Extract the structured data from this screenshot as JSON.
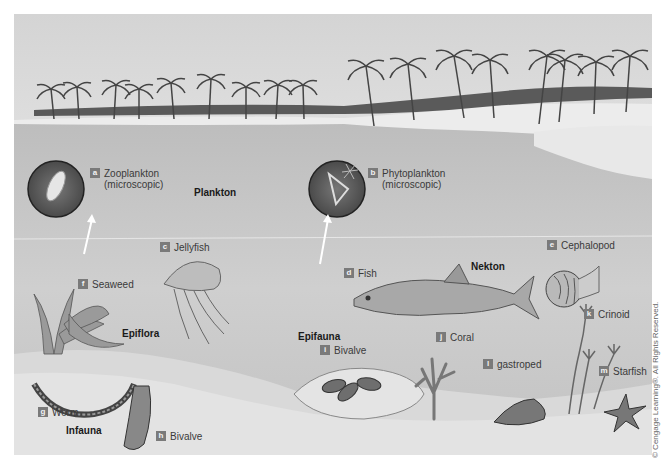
{
  "figure": {
    "colors": {
      "sky": "#dcdcdc",
      "sea": "#c4c4c4",
      "sand": "#e6e6e6",
      "badge": "#7a7a7a",
      "text": "#3a3a3a"
    }
  },
  "zones": {
    "plankton": "Plankton",
    "nekton": "Nekton",
    "epiflora": "Epiflora",
    "epifauna": "Epifauna",
    "infauna": "Infauna"
  },
  "labels": [
    {
      "letter": "a",
      "line1": "Zooplankton",
      "line2": "(microscopic)"
    },
    {
      "letter": "b",
      "line1": "Phytoplankton",
      "line2": "(microscopic)"
    },
    {
      "letter": "c",
      "line1": "Jellyfish"
    },
    {
      "letter": "d",
      "line1": "Fish"
    },
    {
      "letter": "e",
      "line1": "Cephalopod"
    },
    {
      "letter": "f",
      "line1": "Seaweed"
    },
    {
      "letter": "g",
      "line1": "Worm"
    },
    {
      "letter": "h",
      "line1": "Bivalve"
    },
    {
      "letter": "i",
      "line1": "Bivalve"
    },
    {
      "letter": "j",
      "line1": "Coral"
    },
    {
      "letter": "k",
      "line1": "Crinoid"
    },
    {
      "letter": "l",
      "line1": "gastroped"
    },
    {
      "letter": "m",
      "line1": "Starfish"
    }
  ],
  "copyright": "© Cengage Learning®. All Rights Reserved."
}
